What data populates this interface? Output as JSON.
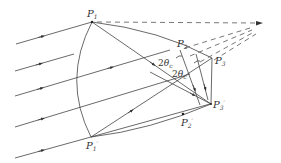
{
  "diagram": {
    "points": {
      "P1": {
        "label": "P",
        "sub": "1",
        "x": 92,
        "y": 22
      },
      "P2": {
        "label": "P",
        "sub": "2",
        "x": 180,
        "y": 50
      },
      "P3": {
        "label": "P",
        "sub": "3",
        "x": 212,
        "y": 58
      },
      "P1p": {
        "label": "P",
        "sub": "1'",
        "x": 91,
        "y": 137
      },
      "P2p": {
        "label": "P",
        "sub": "2'",
        "x": 183,
        "y": 114
      },
      "P3p": {
        "label": "P",
        "sub": "3'",
        "x": 211,
        "y": 104
      },
      "focus": {
        "x": 262,
        "y": 23
      }
    },
    "angle_labels": [
      {
        "text": "2θ",
        "sub": "c"
      },
      {
        "text": "2θ",
        "sub": "c"
      }
    ]
  }
}
